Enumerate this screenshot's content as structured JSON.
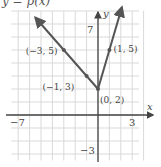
{
  "title": "y = p(x)",
  "chart_data": {
    "type": "line",
    "title": "y = p(x)",
    "xlabel": "x",
    "ylabel": "y",
    "xlim": [
      -7,
      3
    ],
    "ylim": [
      -3,
      7
    ],
    "x_tick_labels": [
      "-7",
      "3"
    ],
    "y_tick_labels": [
      "7",
      "-3"
    ],
    "grid": true,
    "series": [
      {
        "name": "p(x)",
        "points": [
          {
            "x": -5.5,
            "y": 7.5
          },
          {
            "x": -3,
            "y": 5
          },
          {
            "x": -1,
            "y": 3
          },
          {
            "x": 0,
            "y": 2
          },
          {
            "x": 1,
            "y": 5
          },
          {
            "x": 2.1,
            "y": 8.3
          }
        ],
        "labeled_points": [
          {
            "x": -3,
            "y": 5,
            "label": "(−3, 5)"
          },
          {
            "x": -1,
            "y": 3,
            "label": "(−1, 3)"
          },
          {
            "x": 0,
            "y": 2,
            "label": "(0, 2)"
          },
          {
            "x": 1,
            "y": 5,
            "label": "(1, 5)"
          }
        ],
        "arrows_at_ends": true
      }
    ],
    "colors": {
      "line": "#555555",
      "grid": "#d9d9d9",
      "axis": "#444444"
    }
  }
}
